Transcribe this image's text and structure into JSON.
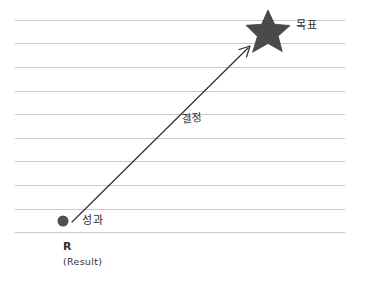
{
  "diagram": {
    "type": "concept-sketch",
    "background_color": "#ffffff",
    "line_color": "#c9c9c9",
    "ink_color": "#2f2f2f",
    "accent_color": "#4a4a4a",
    "ruled_lines": {
      "count": 10,
      "first_y": 20,
      "spacing": 23.6,
      "left": 15,
      "right": 345
    },
    "nodes": {
      "start": {
        "label": "성과",
        "sub_label": "R",
        "sub_label_detail": "(Result)",
        "shape": "filled-circle",
        "color": "#4f4f4f",
        "x": 63,
        "y": 221,
        "radius": 5.5
      },
      "end": {
        "label": "목표",
        "shape": "five-pointed-star",
        "color": "#4a4a4a",
        "x": 268,
        "y": 31,
        "outer_radius": 21,
        "inner_radius": 8.5
      }
    },
    "connector": {
      "label": "결정",
      "style": "straight-arrow",
      "color": "#2f2f2f",
      "from_x": 72,
      "from_y": 222,
      "to_x": 250,
      "to_y": 46
    }
  }
}
